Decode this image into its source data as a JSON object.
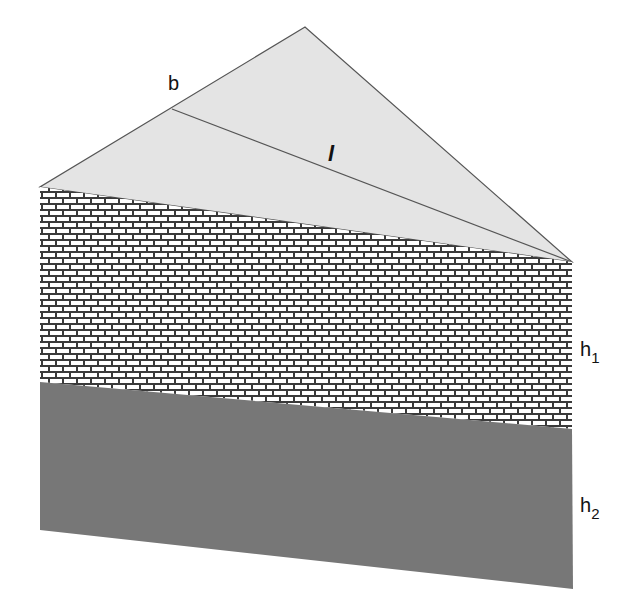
{
  "diagram": {
    "colors": {
      "background": "#ffffff",
      "roof_fill": "#e4e4e4",
      "roof_stroke": "#555555",
      "brick_mortar": "#3a3a3a",
      "brick_face": "#ffffff",
      "lower_layer": "#777777"
    },
    "labels": {
      "b": "b",
      "l": "l",
      "h1_main": "h",
      "h1_sub": "1",
      "h2_main": "h",
      "h2_sub": "2"
    },
    "points": {
      "apex": [
        305,
        27
      ],
      "left_top": [
        40,
        187
      ],
      "right_top": [
        572,
        262
      ],
      "b_point": [
        172,
        109
      ],
      "left_mid": [
        40,
        382
      ],
      "right_mid": [
        572,
        429
      ],
      "left_bottom": [
        40,
        530
      ],
      "right_bottom": [
        573,
        589
      ]
    }
  }
}
